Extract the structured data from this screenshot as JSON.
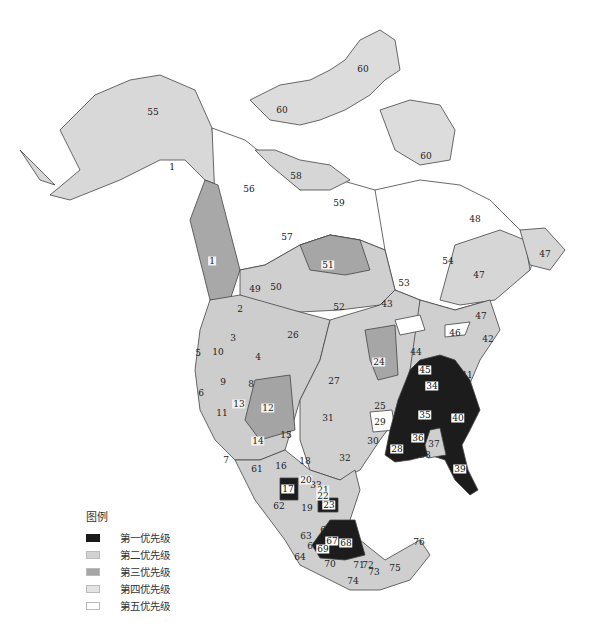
{
  "legend": {
    "title": "图例",
    "items": [
      {
        "label": "第一优先级",
        "color": "#1a1a1a"
      },
      {
        "label": "第二优先级",
        "color": "#d2d2d2"
      },
      {
        "label": "第三优先级",
        "color": "#a6a6a6"
      },
      {
        "label": "第四优先级",
        "color": "#e3e3e3"
      },
      {
        "label": "第五优先级",
        "color": "#ffffff"
      }
    ]
  },
  "regions": [
    {
      "id": "55",
      "x": 153,
      "y": 112,
      "priority": 2
    },
    {
      "id": "1",
      "x": 172,
      "y": 167,
      "priority": 2
    },
    {
      "id": "1",
      "x": 212,
      "y": 261,
      "priority": 3
    },
    {
      "id": "60",
      "x": 282,
      "y": 110,
      "priority": 2
    },
    {
      "id": "60",
      "x": 363,
      "y": 69,
      "priority": 2
    },
    {
      "id": "60",
      "x": 426,
      "y": 156,
      "priority": 2
    },
    {
      "id": "58",
      "x": 296,
      "y": 176,
      "priority": 2
    },
    {
      "id": "56",
      "x": 249,
      "y": 189,
      "priority": 5
    },
    {
      "id": "59",
      "x": 339,
      "y": 203,
      "priority": 5
    },
    {
      "id": "57",
      "x": 287,
      "y": 237,
      "priority": 5
    },
    {
      "id": "51",
      "x": 328,
      "y": 265,
      "priority": 3
    },
    {
      "id": "48",
      "x": 475,
      "y": 219,
      "priority": 5
    },
    {
      "id": "54",
      "x": 448,
      "y": 261,
      "priority": 5
    },
    {
      "id": "53",
      "x": 404,
      "y": 283,
      "priority": 5
    },
    {
      "id": "47",
      "x": 479,
      "y": 275,
      "priority": 2
    },
    {
      "id": "47",
      "x": 545,
      "y": 254,
      "priority": 2
    },
    {
      "id": "47",
      "x": 481,
      "y": 316,
      "priority": 2
    },
    {
      "id": "43",
      "x": 387,
      "y": 304,
      "priority": 2
    },
    {
      "id": "49",
      "x": 255,
      "y": 289,
      "priority": 2
    },
    {
      "id": "50",
      "x": 276,
      "y": 287,
      "priority": 2
    },
    {
      "id": "52",
      "x": 339,
      "y": 307,
      "priority": 2
    },
    {
      "id": "2",
      "x": 240,
      "y": 309,
      "priority": 2
    },
    {
      "id": "26",
      "x": 293,
      "y": 335,
      "priority": 2
    },
    {
      "id": "3",
      "x": 233,
      "y": 338,
      "priority": 2
    },
    {
      "id": "4",
      "x": 258,
      "y": 357,
      "priority": 2
    },
    {
      "id": "5",
      "x": 198,
      "y": 353,
      "priority": 2
    },
    {
      "id": "10",
      "x": 218,
      "y": 352,
      "priority": 2
    },
    {
      "id": "9",
      "x": 223,
      "y": 382,
      "priority": 2
    },
    {
      "id": "8",
      "x": 251,
      "y": 384,
      "priority": 2
    },
    {
      "id": "6",
      "x": 201,
      "y": 393,
      "priority": 2
    },
    {
      "id": "13",
      "x": 239,
      "y": 404,
      "priority": 3
    },
    {
      "id": "12",
      "x": 268,
      "y": 408,
      "priority": 3
    },
    {
      "id": "11",
      "x": 222,
      "y": 413,
      "priority": 2
    },
    {
      "id": "14",
      "x": 258,
      "y": 441,
      "priority": 3
    },
    {
      "id": "15",
      "x": 286,
      "y": 435,
      "priority": 2
    },
    {
      "id": "27",
      "x": 334,
      "y": 381,
      "priority": 2
    },
    {
      "id": "31",
      "x": 328,
      "y": 418,
      "priority": 2
    },
    {
      "id": "25",
      "x": 380,
      "y": 406,
      "priority": 2
    },
    {
      "id": "29",
      "x": 380,
      "y": 422,
      "priority": 5
    },
    {
      "id": "30",
      "x": 373,
      "y": 441,
      "priority": 2
    },
    {
      "id": "32",
      "x": 345,
      "y": 458,
      "priority": 2
    },
    {
      "id": "24",
      "x": 379,
      "y": 362,
      "priority": 3
    },
    {
      "id": "44",
      "x": 416,
      "y": 352,
      "priority": 2
    },
    {
      "id": "46",
      "x": 455,
      "y": 333,
      "priority": 2
    },
    {
      "id": "42",
      "x": 488,
      "y": 339,
      "priority": 2
    },
    {
      "id": "45",
      "x": 425,
      "y": 370,
      "priority": 1
    },
    {
      "id": "41",
      "x": 467,
      "y": 375,
      "priority": 2
    },
    {
      "id": "34",
      "x": 432,
      "y": 386,
      "priority": 1
    },
    {
      "id": "35",
      "x": 425,
      "y": 415,
      "priority": 1
    },
    {
      "id": "40",
      "x": 458,
      "y": 418,
      "priority": 1
    },
    {
      "id": "36",
      "x": 418,
      "y": 438,
      "priority": 1
    },
    {
      "id": "37",
      "x": 434,
      "y": 444,
      "priority": 2
    },
    {
      "id": "38",
      "x": 425,
      "y": 455,
      "priority": 2
    },
    {
      "id": "28",
      "x": 397,
      "y": 449,
      "priority": 1
    },
    {
      "id": "39",
      "x": 460,
      "y": 469,
      "priority": 1
    },
    {
      "id": "7",
      "x": 226,
      "y": 460,
      "priority": 2
    },
    {
      "id": "61",
      "x": 257,
      "y": 469,
      "priority": 2
    },
    {
      "id": "16",
      "x": 281,
      "y": 466,
      "priority": 2
    },
    {
      "id": "18",
      "x": 305,
      "y": 461,
      "priority": 2
    },
    {
      "id": "33",
      "x": 316,
      "y": 485,
      "priority": 2
    },
    {
      "id": "17",
      "x": 288,
      "y": 489,
      "priority": 1
    },
    {
      "id": "20",
      "x": 306,
      "y": 480,
      "priority": 3
    },
    {
      "id": "19",
      "x": 307,
      "y": 508,
      "priority": 2
    },
    {
      "id": "21",
      "x": 323,
      "y": 490,
      "priority": 3
    },
    {
      "id": "22",
      "x": 323,
      "y": 496,
      "priority": 3
    },
    {
      "id": "23",
      "x": 329,
      "y": 505,
      "priority": 1
    },
    {
      "id": "62",
      "x": 279,
      "y": 506,
      "priority": 2
    },
    {
      "id": "66",
      "x": 326,
      "y": 530,
      "priority": 2
    },
    {
      "id": "63",
      "x": 306,
      "y": 536,
      "priority": 2
    },
    {
      "id": "67",
      "x": 332,
      "y": 541,
      "priority": 1
    },
    {
      "id": "68",
      "x": 346,
      "y": 543,
      "priority": 1
    },
    {
      "id": "65",
      "x": 313,
      "y": 546,
      "priority": 2
    },
    {
      "id": "69",
      "x": 323,
      "y": 549,
      "priority": 1
    },
    {
      "id": "64",
      "x": 300,
      "y": 557,
      "priority": 2
    },
    {
      "id": "70",
      "x": 330,
      "y": 564,
      "priority": 2
    },
    {
      "id": "71",
      "x": 359,
      "y": 565,
      "priority": 2
    },
    {
      "id": "72",
      "x": 368,
      "y": 565,
      "priority": 2
    },
    {
      "id": "73",
      "x": 374,
      "y": 572,
      "priority": 2
    },
    {
      "id": "74",
      "x": 353,
      "y": 581,
      "priority": 2
    },
    {
      "id": "75",
      "x": 395,
      "y": 568,
      "priority": 2
    },
    {
      "id": "76",
      "x": 419,
      "y": 542,
      "priority": 2
    }
  ]
}
